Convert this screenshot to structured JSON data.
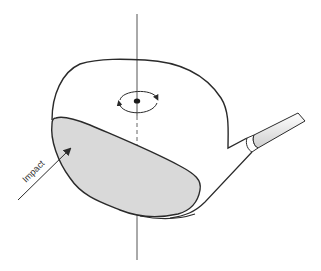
{
  "diagram": {
    "labels": {
      "impact": "Impact"
    },
    "elements": {
      "vertical_axis": "center-of-gravity vertical axis",
      "spin_indicator": "rotation arrows around center of gravity",
      "face": "shaded club face",
      "hosel": "hosel and shaft"
    },
    "colors": {
      "outline": "#2a2a2a",
      "face_fill": "#d9d9d9",
      "axis": "#555555",
      "shaft_fill": "#e6e6e6",
      "background": "#ffffff"
    }
  }
}
